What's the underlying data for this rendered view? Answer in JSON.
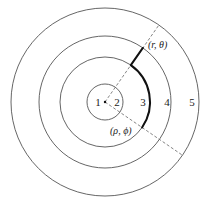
{
  "diagram": {
    "type": "concentric-regions",
    "center": {
      "x": 105,
      "y": 102
    },
    "rings": [
      {
        "id": "ring-1",
        "radius": 18
      },
      {
        "id": "ring-2",
        "radius": 45
      },
      {
        "id": "ring-3",
        "radius": 66
      },
      {
        "id": "ring-4",
        "radius": 94
      }
    ],
    "region_labels": [
      {
        "text": "1",
        "x": 98,
        "y": 106
      },
      {
        "text": "2",
        "x": 117,
        "y": 106
      },
      {
        "text": "3",
        "x": 143,
        "y": 106
      },
      {
        "text": "4",
        "x": 167,
        "y": 106
      },
      {
        "text": "5",
        "x": 192,
        "y": 106
      }
    ],
    "points": {
      "start": {
        "label": "(r, θ)",
        "x": 148,
        "y": 48
      },
      "end": {
        "label": "(ρ, ϕ)",
        "x": 110,
        "y": 134
      }
    },
    "rays": [
      {
        "id": "ray-theta",
        "angle_deg": 55
      },
      {
        "id": "ray-phi",
        "angle_deg": -34.5
      }
    ],
    "colors": {
      "ring": "#555555",
      "ray": "#666666",
      "path": "#111111",
      "text": "#222222"
    }
  }
}
